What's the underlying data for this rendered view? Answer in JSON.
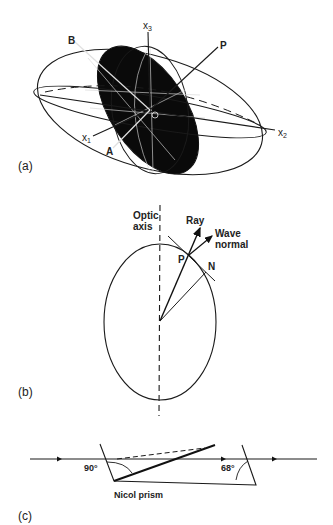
{
  "panels": {
    "a": {
      "label": "(a)",
      "axes": {
        "x1": "x",
        "x1_sub": "1",
        "x2": "x",
        "x2_sub": "2",
        "x3": "x",
        "x3_sub": "3"
      },
      "points": {
        "A": "A",
        "B": "B",
        "P": "P",
        "O": "O"
      },
      "colors": {
        "section": "#0a0a0a",
        "line": "#1a1a1a"
      }
    },
    "b": {
      "label": "(b)",
      "optic_axis": [
        "Optic",
        "axis"
      ],
      "ray": "Ray",
      "wave_normal": [
        "Wave",
        "normal"
      ],
      "points": {
        "P": "P",
        "N": "N"
      }
    },
    "c": {
      "label": "(c)",
      "angle_left": "90°",
      "angle_right": "68°",
      "caption": "Nicol prism"
    }
  }
}
